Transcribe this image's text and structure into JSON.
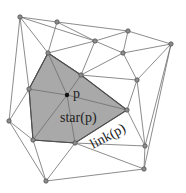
{
  "diagram": {
    "title": "",
    "labels": {
      "center_point": "p",
      "star": "star(p)",
      "link": "link(p)"
    },
    "colors": {
      "star_fill": "#a9a9a9",
      "edge": "#6e6e6e",
      "vertex": "#8c8c8c",
      "center": "#111111",
      "background": "#ffffff"
    },
    "vertices": {
      "v1": [
        20,
        17
      ],
      "v2": [
        57,
        22
      ],
      "v3": [
        128,
        31
      ],
      "v4": [
        171,
        44
      ],
      "v5": [
        95,
        41
      ],
      "v6": [
        123,
        53
      ],
      "v7": [
        48,
        53
      ],
      "v8": [
        81,
        75
      ],
      "v9": [
        29,
        89
      ],
      "v10": [
        137,
        80
      ],
      "p": [
        67,
        95
      ],
      "v11": [
        127,
        110
      ],
      "v12": [
        9,
        121
      ],
      "v13": [
        33,
        140
      ],
      "v14": [
        75,
        143
      ],
      "v15": [
        145,
        146
      ],
      "v16": [
        144,
        169
      ],
      "v17": [
        46,
        181
      ]
    },
    "star_polygon": [
      "v7",
      "v8",
      "v11",
      "v14",
      "v13",
      "v9"
    ],
    "link_edges": [
      [
        "v7",
        "v8"
      ],
      [
        "v8",
        "v11"
      ],
      [
        "v11",
        "v14"
      ],
      [
        "v14",
        "v13"
      ],
      [
        "v13",
        "v9"
      ],
      [
        "v9",
        "v7"
      ]
    ]
  }
}
